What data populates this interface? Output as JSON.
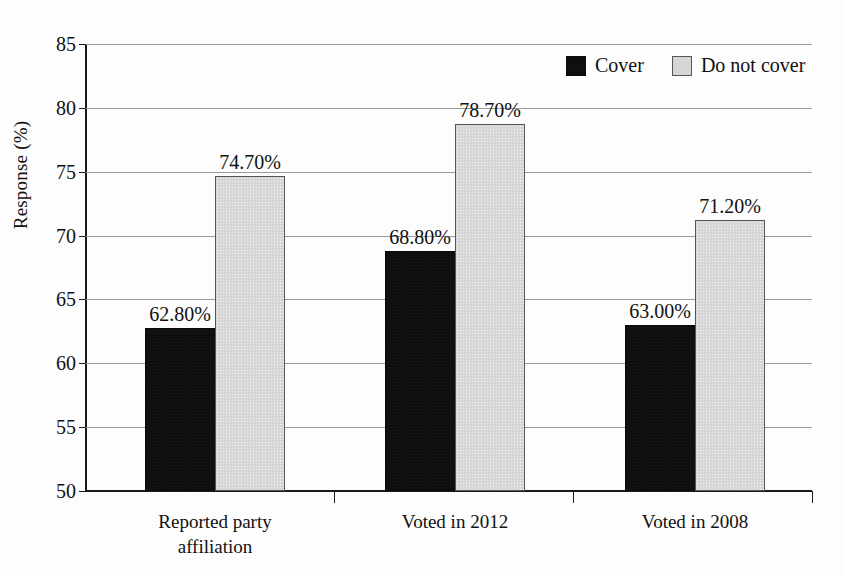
{
  "chart_data": {
    "type": "bar",
    "title": "",
    "subtitle": "",
    "xlabel": "",
    "ylabel": "Response (%)",
    "ylim": [
      50,
      85
    ],
    "yticks": [
      50,
      55,
      60,
      65,
      70,
      75,
      80,
      85
    ],
    "ytick_labels": [
      "50",
      "55",
      "60",
      "65",
      "70",
      "75",
      "80",
      "85"
    ],
    "grid": true,
    "legend_position": "top-right",
    "categories": [
      "Reported party affiliation",
      "Voted in 2012",
      "Voted in 2008"
    ],
    "category_lines": [
      [
        "Reported party",
        "affiliation"
      ],
      [
        "Voted in 2012"
      ],
      [
        "Voted in 2008"
      ]
    ],
    "series": [
      {
        "name": "Cover",
        "color": "#100f0f",
        "values": [
          62.8,
          68.8,
          63.0
        ],
        "labels": [
          "62.80%",
          "68.80%",
          "63.00%"
        ]
      },
      {
        "name": "Do not cover",
        "color": "#d6d6d6",
        "values": [
          74.7,
          78.7,
          71.2
        ],
        "labels": [
          "74.70%",
          "78.70%",
          "71.20%"
        ]
      }
    ]
  },
  "legend": {
    "entries": [
      {
        "label": "Cover",
        "swatch": "black-square-swatch"
      },
      {
        "label": "Do not cover",
        "swatch": "light-gray-square-swatch"
      }
    ]
  }
}
